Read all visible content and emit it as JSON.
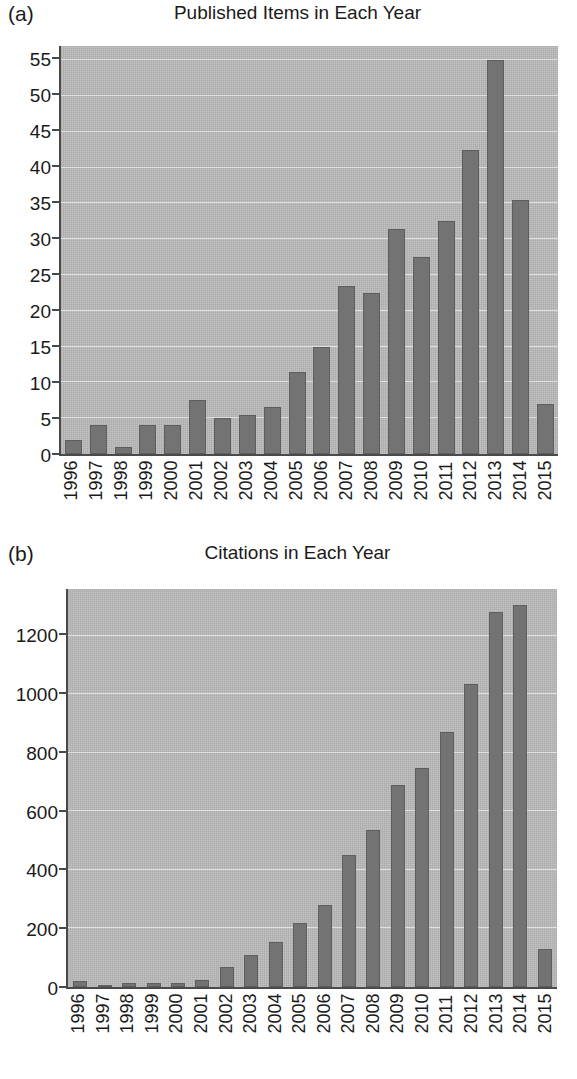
{
  "figure": {
    "background_color": "#ffffff",
    "plot_background_color": "#b4b4b4",
    "bar_color": "#737373",
    "axis_color": "#4a4a4a",
    "gridline_color": "#e8e8e8"
  },
  "panels": [
    {
      "letter": "(a)",
      "title": "Published Items in Each Year"
    },
    {
      "letter": "(b)",
      "title": "Citations in Each Year"
    }
  ],
  "chart_data": [
    {
      "type": "bar",
      "title": "Published Items in Each Year",
      "panel": "(a)",
      "xlabel": "",
      "ylabel": "",
      "ylim": [
        0,
        57
      ],
      "yticks": [
        0,
        5,
        10,
        15,
        20,
        25,
        30,
        35,
        40,
        45,
        50,
        55
      ],
      "ytick_labels": [
        "0",
        "5",
        "10",
        "15",
        "20",
        "25",
        "30",
        "35",
        "40",
        "45",
        "50",
        "55"
      ],
      "grid": true,
      "legend": false,
      "categories": [
        "1996",
        "1997",
        "1998",
        "1999",
        "2000",
        "2001",
        "2002",
        "2003",
        "2004",
        "2005",
        "2006",
        "2007",
        "2008",
        "2009",
        "2010",
        "2011",
        "2012",
        "2013",
        "2014",
        "2015"
      ],
      "values": [
        2,
        4,
        1,
        4,
        4,
        7.5,
        5,
        5.5,
        6.5,
        11.5,
        15,
        23.5,
        22.5,
        31.5,
        27.5,
        32.5,
        42.5,
        55,
        35.5,
        7
      ]
    },
    {
      "type": "bar",
      "title": "Citations in Each Year",
      "panel": "(b)",
      "xlabel": "",
      "ylabel": "",
      "ylim": [
        0,
        1360
      ],
      "yticks": [
        0,
        200,
        400,
        600,
        800,
        1000,
        1200
      ],
      "ytick_labels": [
        "0",
        "200",
        "400",
        "600",
        "800",
        "1000",
        "1200"
      ],
      "grid": true,
      "legend": false,
      "categories": [
        "1996",
        "1997",
        "1998",
        "1999",
        "2000",
        "2001",
        "2002",
        "2003",
        "2004",
        "2005",
        "2006",
        "2007",
        "2008",
        "2009",
        "2010",
        "2011",
        "2012",
        "2013",
        "2014",
        "2015"
      ],
      "values": [
        20,
        5,
        15,
        15,
        15,
        25,
        70,
        110,
        155,
        220,
        280,
        450,
        535,
        690,
        750,
        870,
        1035,
        1280,
        1305,
        130
      ]
    }
  ]
}
